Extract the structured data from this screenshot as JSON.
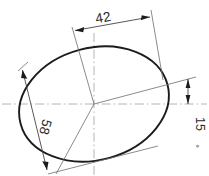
{
  "drawing": {
    "kind": "engineering-dimension-drawing",
    "shape": "ellipse",
    "background_color": "#ffffff",
    "outline_color": "#1b1b1b",
    "centerline_color": "#b4b4b4",
    "dimension_line_color": "#3a3a3a",
    "text_color": "#2a2a2a"
  },
  "dimensions": {
    "minor_axis": {
      "label": "42",
      "name": "minor-axis-dimension",
      "rotation_deg": -7
    },
    "major_axis": {
      "label": "58",
      "name": "major-axis-dimension",
      "rotation_deg": 105
    },
    "tilt_angle": {
      "label": "15",
      "unit_symbol": "°",
      "name": "tilt-angle-dimension",
      "rotation_deg": 90
    }
  },
  "geometry": {
    "ellipse": {
      "center_x": 94,
      "center_y": 104,
      "radius_x": 76,
      "radius_y": 56,
      "rotation_deg": -15
    },
    "horizontal_centerline": {
      "x1": 2,
      "y1": 104,
      "x2": 207,
      "y2": 104
    },
    "vertical_centerline": {
      "x1": 94,
      "y1": 33,
      "x2": 94,
      "y2": 175
    }
  }
}
